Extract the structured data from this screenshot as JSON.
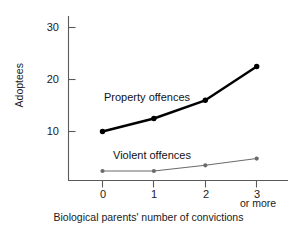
{
  "chart_data": {
    "type": "line",
    "title": "",
    "xlabel": "Biological parents' number of convictions",
    "ylabel": "Adoptees",
    "x": [
      0,
      1,
      2,
      3
    ],
    "categories": [
      "0",
      "1",
      "2",
      "3"
    ],
    "xtick_sublabel": "or more",
    "ylim": [
      0,
      33
    ],
    "xlim": [
      -0.65,
      3.45
    ],
    "yticks": [
      10,
      20,
      30
    ],
    "ytick_labels": [
      "10",
      "20",
      "30"
    ],
    "grid": false,
    "legend_position": "inline-annotation",
    "series": [
      {
        "name": "Property offences",
        "values": [
          10.0,
          12.5,
          16.0,
          22.5
        ],
        "color": "#000000",
        "line_width": 2.4,
        "marker": "circle"
      },
      {
        "name": "Violent offences",
        "values": [
          2.4,
          2.4,
          3.5,
          4.8
        ],
        "color": "#6b6b6b",
        "line_width": 1.1,
        "marker": "circle"
      }
    ],
    "annotations": [
      {
        "text": "Property offences",
        "series": "Property offences"
      },
      {
        "text": "Violent offences",
        "series": "Violent offences"
      }
    ]
  },
  "axes": {
    "y_title": "Adoptees",
    "x_title": "Biological parents' number of convictions",
    "y_ticks": [
      {
        "label": "30"
      },
      {
        "label": "20"
      },
      {
        "label": "10"
      }
    ],
    "x_ticks": [
      {
        "label": "0"
      },
      {
        "label": "1"
      },
      {
        "label": "2"
      },
      {
        "label": "3"
      }
    ],
    "x_tick_extra": "or more",
    "spine_color": "#5a5a5a"
  }
}
